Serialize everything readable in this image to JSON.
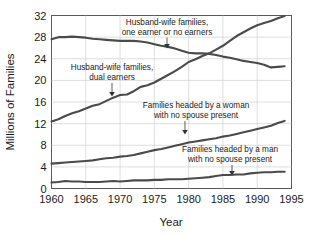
{
  "chart_data": {
    "type": "line",
    "title": "",
    "xlabel": "Year",
    "ylabel": "Millions of Families",
    "xlim": [
      1960,
      1995
    ],
    "ylim": [
      0,
      32
    ],
    "xticks": [
      1960,
      1965,
      1970,
      1975,
      1980,
      1985,
      1990,
      1995
    ],
    "yticks": [
      0,
      4,
      8,
      12,
      16,
      20,
      24,
      28,
      32
    ],
    "grid": true,
    "legend_position": "inline-annotations",
    "line_color": "#4a4a4a",
    "grid_color": "#cfcfcf",
    "frame_color": "#5a5a5a",
    "background_color": "#ffffff",
    "x": [
      1960,
      1961,
      1962,
      1963,
      1964,
      1965,
      1966,
      1967,
      1968,
      1969,
      1970,
      1971,
      1972,
      1973,
      1974,
      1975,
      1976,
      1977,
      1978,
      1979,
      1980,
      1981,
      1982,
      1983,
      1984,
      1985,
      1986,
      1987,
      1988,
      1989,
      1990,
      1991,
      1992,
      1993,
      1994
    ],
    "series": [
      {
        "name": "Husband-wife families, one earner or no earners",
        "values": [
          27.6,
          28.0,
          28.0,
          28.1,
          28.0,
          27.9,
          27.7,
          27.6,
          27.5,
          27.4,
          27.3,
          27.3,
          27.3,
          27.2,
          27.0,
          26.7,
          26.4,
          26.2,
          25.9,
          25.5,
          25.1,
          25.0,
          25.0,
          24.9,
          24.7,
          24.4,
          24.2,
          23.9,
          23.6,
          23.4,
          23.2,
          22.9,
          22.4,
          22.5,
          22.6
        ]
      },
      {
        "name": "Husband-wife families, dual earners",
        "values": [
          12.4,
          12.8,
          13.4,
          13.9,
          14.3,
          14.8,
          15.3,
          15.6,
          16.2,
          16.8,
          17.3,
          17.4,
          18.0,
          18.8,
          19.1,
          19.6,
          20.3,
          21.0,
          21.7,
          22.5,
          23.4,
          23.9,
          24.5,
          25.0,
          25.7,
          26.4,
          27.3,
          28.2,
          28.9,
          29.6,
          30.2,
          30.6,
          31.0,
          31.5,
          31.9
        ]
      },
      {
        "name": "Families headed by a woman with no spouse present",
        "values": [
          4.6,
          4.7,
          4.8,
          4.9,
          5.0,
          5.1,
          5.2,
          5.4,
          5.6,
          5.7,
          5.9,
          6.0,
          6.2,
          6.5,
          6.8,
          7.1,
          7.3,
          7.6,
          7.9,
          8.2,
          8.5,
          8.7,
          8.9,
          9.1,
          9.3,
          9.6,
          9.8,
          10.1,
          10.4,
          10.7,
          11.0,
          11.3,
          11.6,
          12.1,
          12.5
        ]
      },
      {
        "name": "Families headed by a man with no spouse present",
        "values": [
          1.1,
          1.2,
          1.4,
          1.3,
          1.3,
          1.2,
          1.2,
          1.2,
          1.3,
          1.4,
          1.3,
          1.4,
          1.5,
          1.5,
          1.5,
          1.6,
          1.6,
          1.7,
          1.7,
          1.7,
          1.8,
          1.9,
          2.0,
          2.1,
          2.3,
          2.5,
          2.5,
          2.6,
          2.6,
          2.8,
          2.9,
          3.0,
          3.0,
          3.1,
          3.1
        ]
      }
    ],
    "annotations": [
      {
        "id": "annot-one-earner",
        "line1": "Husband-wife families,",
        "line2": "one earner or no earners"
      },
      {
        "id": "annot-dual-earners",
        "line1": "Husband-wife families,",
        "line2": "dual earners"
      },
      {
        "id": "annot-woman-headed",
        "line1": "Families headed by a woman",
        "line2": "with no spouse present"
      },
      {
        "id": "annot-man-headed",
        "line1": "Families headed by a man",
        "line2": "with no spouse present"
      }
    ]
  },
  "axes": {
    "x_tick_labels": [
      "1960",
      "1965",
      "1970",
      "1975",
      "1980",
      "1985",
      "1990",
      "1995"
    ],
    "y_tick_labels": [
      "0",
      "4",
      "8",
      "12",
      "16",
      "20",
      "24",
      "28",
      "32"
    ],
    "x_title": "Year",
    "y_title": "Millions of Families"
  }
}
